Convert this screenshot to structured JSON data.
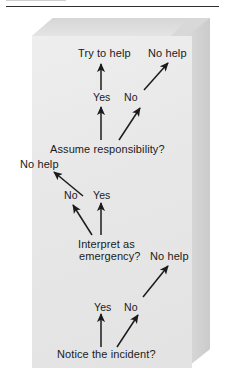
{
  "figure": {
    "kind": "flowchart",
    "orientation": "bottom-to-top",
    "style": {
      "box_front_color": "#e9e9e9",
      "box_top_color": "#dcdcdc",
      "box_side_color": "#d2d2d2",
      "text_color": "#1b1b1b",
      "arrow_color": "#1b1b1b",
      "page_background": "#ffffff"
    }
  },
  "nodes": {
    "start": "Notice the incident?",
    "step2": "Interpret as",
    "step2b": "emergency?",
    "step3": "Assume responsibility?"
  },
  "outcomes": {
    "help": "Try to help",
    "no_help_top": "No help",
    "no_help_middle": "No help",
    "no_help_bottom": "No help"
  },
  "edges": {
    "bottom_yes": "Yes",
    "bottom_no": "No",
    "middle_no": "No",
    "middle_yes": "Yes",
    "top_yes": "Yes",
    "top_no": "No"
  },
  "flow": [
    {
      "from": "Notice the incident?",
      "label": "Yes",
      "to": "Interpret as emergency?"
    },
    {
      "from": "Notice the incident?",
      "label": "No",
      "to": "No help"
    },
    {
      "from": "Interpret as emergency?",
      "label": "Yes",
      "to": "Assume responsibility?"
    },
    {
      "from": "Interpret as emergency?",
      "label": "No",
      "to": "No help"
    },
    {
      "from": "Assume responsibility?",
      "label": "Yes",
      "to": "Try to help"
    },
    {
      "from": "Assume responsibility?",
      "label": "No",
      "to": "No help"
    }
  ]
}
